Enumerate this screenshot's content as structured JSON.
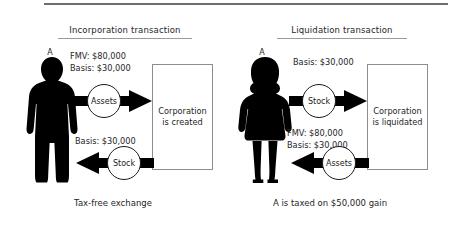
{
  "figure": {
    "panels": [
      {
        "id": "incorporation",
        "title": "Incorporation transaction",
        "person_label": "A",
        "person_icon": "male-silhouette-icon",
        "box_text": "Corporation\nis created",
        "caption": "Tax-free exchange",
        "flows": [
          {
            "id": "assets-to-corp",
            "node_label": "Assets",
            "direction": "right",
            "note": "FMV: $80,000\nBasis: $30,000"
          },
          {
            "id": "stock-to-shareholder",
            "node_label": "Stock",
            "direction": "left",
            "note": "Basis: $30,000"
          }
        ]
      },
      {
        "id": "liquidation",
        "title": "Liquidation transaction",
        "person_label": "A",
        "person_icon": "female-silhouette-icon",
        "box_text": "Corporation\nis liquidated",
        "caption": "A is taxed on $50,000 gain",
        "flows": [
          {
            "id": "stock-to-corp",
            "node_label": "Stock",
            "direction": "right",
            "note": "Basis: $30,000"
          },
          {
            "id": "assets-to-shareholder",
            "node_label": "Assets",
            "direction": "left",
            "note": "FMV: $80,000\nBasis: $30,000"
          }
        ]
      }
    ],
    "colors": {
      "ink": "#1a1a1a",
      "arrow": "#000000",
      "box_border": "#8d8d8d",
      "rule": "#6d6d6d",
      "background": "#ffffff"
    }
  }
}
